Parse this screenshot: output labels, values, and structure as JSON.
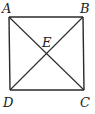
{
  "figure": {
    "type": "square-with-diagonals",
    "stroke_color": "#2a2a2a",
    "background": "#ffffff",
    "vertices": {
      "A": {
        "label": "A",
        "x": 9,
        "y": 17
      },
      "B": {
        "label": "B",
        "x": 83,
        "y": 17
      },
      "C": {
        "label": "C",
        "x": 84,
        "y": 90
      },
      "D": {
        "label": "D",
        "x": 10,
        "y": 90
      }
    },
    "intersection": {
      "label": "E",
      "x": 47,
      "y": 53
    },
    "segments": [
      "AB",
      "BC",
      "CD",
      "DA",
      "AC",
      "BD"
    ]
  }
}
